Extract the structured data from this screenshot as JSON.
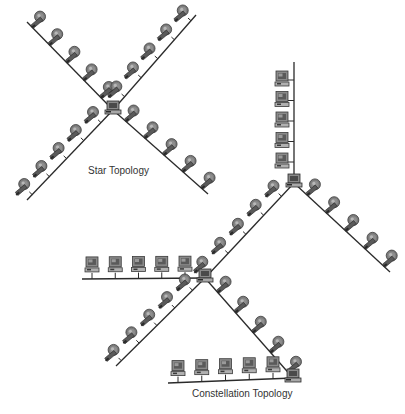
{
  "labels": {
    "star": "Star Topology",
    "constellation": "Constellation Topology"
  },
  "colors": {
    "line": "#2a2a2a",
    "pc_body": "#8a8a8a",
    "pc_dark": "#4a4a4a",
    "pc_light": "#c8c8c8",
    "text": "#333333"
  },
  "star_topology": {
    "hub": {
      "x": 113,
      "y": 110
    },
    "arms": [
      {
        "name": "upper-left",
        "to": [
          27,
          22
        ],
        "pcs": 5,
        "side": "up"
      },
      {
        "name": "upper-right",
        "to": [
          196,
          15
        ],
        "pcs": 5,
        "side": "up"
      },
      {
        "name": "lower-left",
        "to": [
          27,
          200
        ],
        "pcs": 5,
        "side": "up"
      },
      {
        "name": "lower-right",
        "to": [
          208,
          194
        ],
        "pcs": 5,
        "side": "up"
      }
    ]
  },
  "constellation_topology": {
    "hubs": [
      {
        "id": "hub-top",
        "x": 294,
        "y": 183
      },
      {
        "id": "hub-middle",
        "x": 205,
        "y": 278
      },
      {
        "id": "hub-bottom",
        "x": 293,
        "y": 378
      }
    ],
    "segments": [
      {
        "name": "vertical-bus",
        "from": [
          294,
          183
        ],
        "to": [
          294,
          62
        ],
        "pcs": 5,
        "orient": "vertical"
      },
      {
        "name": "top-to-middle",
        "from": [
          294,
          183
        ],
        "to": [
          205,
          278
        ],
        "pcs": 5,
        "orient": "diag"
      },
      {
        "name": "top-lower-right",
        "from": [
          294,
          183
        ],
        "to": [
          390,
          272
        ],
        "pcs": 5,
        "orient": "diag"
      },
      {
        "name": "horizontal-bus-left",
        "from": [
          205,
          278
        ],
        "to": [
          82,
          279
        ],
        "pcs": 5,
        "orient": "horizontal"
      },
      {
        "name": "middle-lower-left",
        "from": [
          205,
          278
        ],
        "to": [
          116,
          366
        ],
        "pcs": 5,
        "orient": "diag"
      },
      {
        "name": "middle-to-bottom",
        "from": [
          205,
          278
        ],
        "to": [
          293,
          378
        ],
        "pcs": 5,
        "orient": "diag"
      },
      {
        "name": "horizontal-bus-bottom",
        "from": [
          293,
          378
        ],
        "to": [
          168,
          383
        ],
        "pcs": 5,
        "orient": "horizontal"
      }
    ]
  }
}
